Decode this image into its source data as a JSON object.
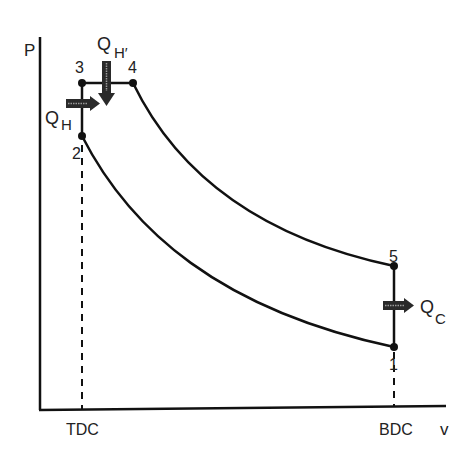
{
  "diagram": {
    "axes": {
      "y_label": "P",
      "x_label": "v",
      "x_ticks": [
        "TDC",
        "BDC"
      ]
    },
    "points": [
      {
        "id": "1",
        "label": "1"
      },
      {
        "id": "2",
        "label": "2"
      },
      {
        "id": "3",
        "label": "3"
      },
      {
        "id": "4",
        "label": "4"
      },
      {
        "id": "5",
        "label": "5"
      }
    ],
    "heat_flows": {
      "qh": {
        "main": "Q",
        "sub": "H"
      },
      "qh_prime": {
        "main": "Q",
        "sub": "H′"
      },
      "qc": {
        "main": "Q",
        "sub": "C"
      }
    },
    "colors": {
      "line": "#111111",
      "arrow_fill": "#2a2a2a",
      "arrow_stripe": "#9a9a9a"
    }
  }
}
